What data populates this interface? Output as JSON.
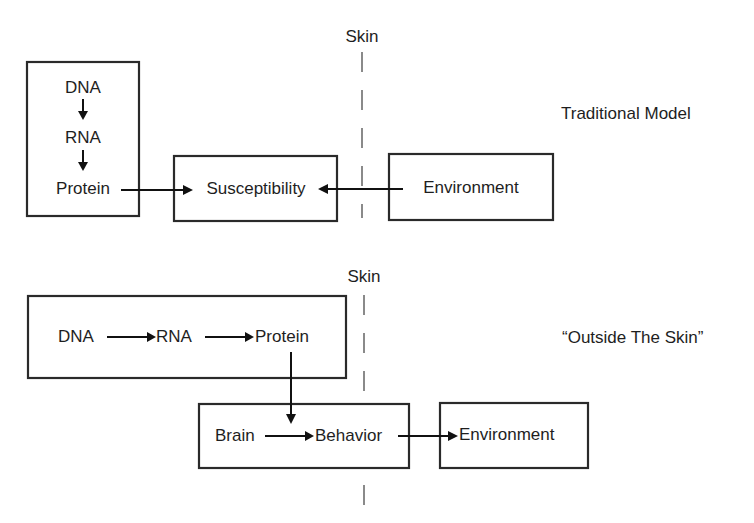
{
  "colors": {
    "box_stroke": "#2a2a2a",
    "arrow": "#111111",
    "skin_line": "#8a8a8a",
    "text": "#1e1e1e",
    "background": "#ffffff"
  },
  "traditional_model": {
    "title": "Traditional Model",
    "skin_label": "Skin",
    "gene_box": {
      "items": [
        "DNA",
        "RNA",
        "Protein"
      ]
    },
    "susceptibility_box": {
      "label": "Susceptibility"
    },
    "environment_box": {
      "label": "Environment"
    },
    "arrows": [
      {
        "from": "DNA",
        "to": "RNA"
      },
      {
        "from": "RNA",
        "to": "Protein"
      },
      {
        "from": "Protein",
        "to": "Susceptibility"
      },
      {
        "from": "Environment",
        "to": "Susceptibility"
      }
    ]
  },
  "outside_the_skin_model": {
    "title": "“Outside The Skin”",
    "skin_label": "Skin",
    "gene_box": {
      "items": [
        "DNA",
        "RNA",
        "Protein"
      ]
    },
    "brain_box": {
      "items": [
        "Brain",
        "Behavior"
      ]
    },
    "environment_box": {
      "label": "Environment"
    },
    "arrows": [
      {
        "from": "DNA",
        "to": "RNA"
      },
      {
        "from": "RNA",
        "to": "Protein"
      },
      {
        "from": "Protein",
        "to": "Brain-Behavior box"
      },
      {
        "from": "Brain",
        "to": "Behavior"
      },
      {
        "from": "Behavior",
        "to": "Environment"
      }
    ]
  }
}
